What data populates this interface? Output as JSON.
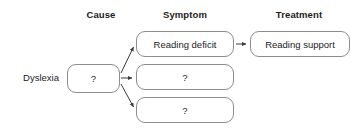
{
  "diagram": {
    "background_color": "#ffffff",
    "stroke_color": "#8d8d8d",
    "arrow_color": "#3a3a3a",
    "text_color": "#1c1c1c",
    "columns": [
      {
        "key": "cause",
        "label": "Cause",
        "center_x": 101,
        "y": 9
      },
      {
        "key": "symptom",
        "label": "Symptom",
        "center_x": 185,
        "y": 9
      },
      {
        "key": "treatment",
        "label": "Treatment",
        "center_x": 299,
        "y": 9
      }
    ],
    "rows": [
      {
        "key": "dyslexia",
        "label": "Dyslexia"
      }
    ],
    "nodes": [
      {
        "key": "cause-unknown",
        "label": "?",
        "column": "cause",
        "x": 67,
        "y": 64,
        "w": 53,
        "h": 29
      },
      {
        "key": "reading-deficit",
        "label": "Reading deficit",
        "column": "symptom",
        "x": 136,
        "y": 31,
        "w": 98,
        "h": 26
      },
      {
        "key": "symptom-unknown-1",
        "label": "?",
        "column": "symptom",
        "x": 136,
        "y": 64,
        "w": 98,
        "h": 26
      },
      {
        "key": "symptom-unknown-2",
        "label": "?",
        "column": "symptom",
        "x": 136,
        "y": 97,
        "w": 98,
        "h": 26
      },
      {
        "key": "reading-support",
        "label": "Reading support",
        "column": "treatment",
        "x": 250,
        "y": 31,
        "w": 100,
        "h": 26
      }
    ],
    "edges": [
      {
        "key": "cause-to-reading-deficit",
        "from": "cause-unknown",
        "to": "reading-deficit",
        "path": "M 121 73 L 134 46"
      },
      {
        "key": "cause-to-symptom-unknown-1",
        "from": "cause-unknown",
        "to": "symptom-unknown-1",
        "path": "M 121 78 L 133 78"
      },
      {
        "key": "cause-to-symptom-unknown-2",
        "from": "cause-unknown",
        "to": "symptom-unknown-2",
        "path": "M 121 84 L 134 108"
      },
      {
        "key": "deficit-to-support",
        "from": "reading-deficit",
        "to": "reading-support",
        "path": "M 236 44 L 247 44"
      }
    ]
  }
}
